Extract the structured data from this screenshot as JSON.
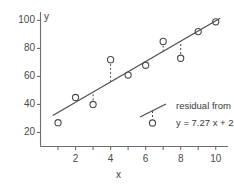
{
  "chart_data": {
    "type": "scatter",
    "title": "",
    "xlabel": "x",
    "ylabel": "y",
    "xlim": [
      0,
      10.7
    ],
    "ylim": [
      10,
      106
    ],
    "grid": false,
    "x": [
      1,
      2,
      3,
      4,
      5,
      6,
      7,
      8,
      9,
      10
    ],
    "values": [
      27,
      45,
      40,
      72,
      61,
      68,
      85,
      73,
      92,
      99
    ],
    "series": [
      {
        "name": "observations",
        "marker": "open-circle",
        "x": [
          1,
          2,
          3,
          4,
          5,
          6,
          7,
          8,
          9,
          10
        ],
        "values": [
          27,
          45,
          40,
          72,
          61,
          68,
          85,
          73,
          92,
          99
        ]
      },
      {
        "name": "regression line",
        "type": "line",
        "equation": "y = 7.27 x + 27",
        "slope": 7.27,
        "intercept": 27,
        "x": [
          0.7,
          10.25
        ],
        "values": [
          32.1,
          101.5
        ]
      }
    ],
    "residuals": [
      {
        "x": 3,
        "y_observed": 40,
        "y_fit": 48.8
      },
      {
        "x": 4,
        "y_observed": 72,
        "y_fit": 56.1
      },
      {
        "x": 7,
        "y_observed": 85,
        "y_fit": 77.9
      },
      {
        "x": 8,
        "y_observed": 73,
        "y_fit": 85.2
      }
    ],
    "xticks": [
      1,
      2,
      3,
      4,
      5,
      6,
      7,
      8,
      9,
      10
    ],
    "xtick_labels": [
      {
        "value": 2,
        "label": "2"
      },
      {
        "value": 4,
        "label": "4"
      },
      {
        "value": 6,
        "label": "6"
      },
      {
        "value": 8,
        "label": "8"
      },
      {
        "value": 10,
        "label": "10"
      }
    ],
    "yticks": [
      20,
      40,
      60,
      80,
      100
    ],
    "ytick_labels": [
      {
        "value": 100,
        "label": "100"
      },
      {
        "value": 80,
        "label": "80"
      },
      {
        "value": 60,
        "label": "60"
      },
      {
        "value": 40,
        "label": "40"
      },
      {
        "value": 20,
        "label": "20"
      }
    ],
    "legend": {
      "position": "inside-lower-right",
      "line1": "residual from",
      "line2": "y = 7.27 x + 27"
    },
    "colors": {
      "axis": "#6e6e6e",
      "line": "#4a4a4a",
      "marker": "#4a4a4a",
      "residual": "#4a4a4a",
      "text": "#3a3a3a",
      "background": "#ffffff"
    }
  },
  "axis_titles": {
    "x": "x",
    "y": "y"
  }
}
